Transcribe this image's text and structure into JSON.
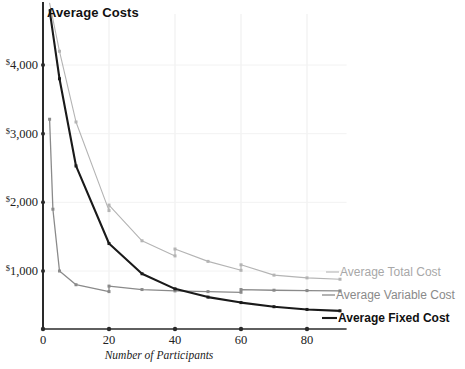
{
  "chart_data": {
    "type": "line",
    "title": "Average Costs",
    "xlabel": "Number of Participants",
    "ylabel": "",
    "xlim": [
      0,
      92
    ],
    "ylim": [
      0,
      4950
    ],
    "grid": true,
    "legend_position": "right-inline",
    "xticks": [
      0,
      20,
      40,
      60,
      80
    ],
    "xtick_labels": [
      "0",
      "20",
      "40",
      "60",
      "80"
    ],
    "yticks": [
      1000,
      2000,
      3000,
      4000
    ],
    "ytick_labels": [
      "$1,000",
      "$2,000",
      "$3,000",
      "$4,000"
    ],
    "series": [
      {
        "name": "Average Total Cost",
        "color": "#b4b4b4",
        "x": [
          2,
          5,
          10,
          20,
          20,
          30,
          40,
          40,
          50,
          60,
          60,
          70,
          80,
          90
        ],
        "values": [
          4900,
          4200,
          3170,
          1880,
          1960,
          1440,
          1220,
          1320,
          1140,
          1010,
          1090,
          940,
          900,
          880
        ]
      },
      {
        "name": "Average Variable Cost",
        "color": "#8a8a8a",
        "x": [
          2,
          3,
          5,
          10,
          20,
          20,
          30,
          40,
          50,
          60,
          60,
          70,
          80,
          90
        ],
        "values": [
          3210,
          1900,
          1000,
          800,
          700,
          780,
          730,
          710,
          700,
          690,
          730,
          720,
          715,
          710
        ]
      },
      {
        "name": "Average Fixed Cost",
        "color": "#1a1a1a",
        "x": [
          2,
          5,
          10,
          20,
          30,
          40,
          50,
          60,
          70,
          80,
          90
        ],
        "values": [
          4800,
          3800,
          2530,
          1400,
          960,
          740,
          620,
          540,
          480,
          440,
          420
        ]
      }
    ]
  },
  "legend": {
    "atc": "Average Total Cost",
    "avc": "Average Variable Cost",
    "afc": "Average Fixed Cost"
  }
}
